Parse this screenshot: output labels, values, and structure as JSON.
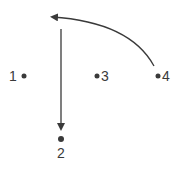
{
  "diagram": {
    "points": [
      {
        "id": "1",
        "label": "1"
      },
      {
        "id": "2",
        "label": "2"
      },
      {
        "id": "3",
        "label": "3"
      },
      {
        "id": "4",
        "label": "4"
      }
    ],
    "arrows": [
      {
        "name": "curved-arrow",
        "from": "4",
        "direction": "up-left"
      },
      {
        "name": "vertical-arrow",
        "direction": "down",
        "to": "2"
      }
    ],
    "colors": {
      "ink": "#3a3a3a",
      "background": "#ffffff"
    }
  }
}
